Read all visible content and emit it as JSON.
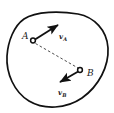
{
  "figure": {
    "type": "vector-diagram",
    "background_color": "#ffffff",
    "stroke_color": "#111111",
    "dash_color": "#444444",
    "points": [
      {
        "id": "A",
        "label": "A",
        "label_x": 22,
        "label_y": 32,
        "marker": "open-circle",
        "marker_x": 33,
        "marker_y": 40.5,
        "marker_radius": 2.6
      },
      {
        "id": "B",
        "label": "B",
        "label_x": 87,
        "label_y": 69,
        "marker": "open-circle",
        "marker_x": 80,
        "marker_y": 70,
        "marker_radius": 2.6
      }
    ],
    "vectors": [
      {
        "id": "vA",
        "label": "v",
        "subscript": "A",
        "from_x": 34.5,
        "from_y": 39.5,
        "to_x": 62,
        "to_y": 22,
        "label_x": 59,
        "label_y": 33
      },
      {
        "id": "vB",
        "label": "v",
        "subscript": "B",
        "from_x": 78.5,
        "from_y": 71.5,
        "to_x": 55,
        "to_y": 85,
        "label_x": 58,
        "label_y": 89
      }
    ],
    "connector": {
      "id": "AB-dashed",
      "style": "dashed",
      "from_x": 35,
      "from_y": 43,
      "to_x": 78,
      "to_y": 68
    },
    "blob": {
      "path": "M 24 19 C 36 11, 60 11, 78 14 C 94 17, 107 30, 108 48 C 109 66, 99 86, 82 98 C 66 109, 44 110, 29 101 C 14 92, 6 73, 7 56 C 8 41, 14 26, 24 19 Z"
    }
  }
}
